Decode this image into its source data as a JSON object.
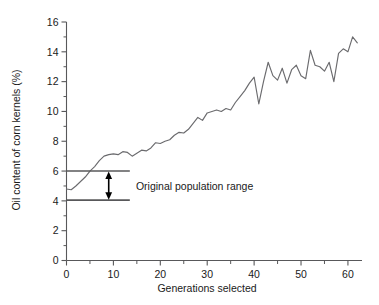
{
  "chart_data": {
    "type": "line",
    "title": "",
    "xlabel": "Generations selected",
    "ylabel": "Oil content of corn kernels (%)",
    "xlim": [
      0,
      63
    ],
    "ylim": [
      0,
      16
    ],
    "xticks": [
      0,
      10,
      20,
      30,
      40,
      50,
      60
    ],
    "xticklabels": [
      "0",
      "10",
      "20",
      "30",
      "40",
      "50",
      "60"
    ],
    "xminorticks": [
      5,
      15,
      25,
      35,
      45,
      55
    ],
    "yticks": [
      0,
      2,
      4,
      6,
      8,
      10,
      12,
      14,
      16
    ],
    "yticklabels": [
      "0",
      "2",
      "4",
      "6",
      "8",
      "10",
      "12",
      "14",
      "16"
    ],
    "yminorticks": [
      1,
      3,
      5,
      7,
      9,
      11,
      13,
      15
    ],
    "grid": false,
    "legend": null,
    "series": [
      {
        "name": "Oil content",
        "color": "#6b6b6e",
        "x": [
          0,
          1,
          2,
          3,
          4,
          5,
          6,
          7,
          8,
          9,
          10,
          11,
          12,
          13,
          14,
          15,
          16,
          17,
          18,
          19,
          20,
          21,
          22,
          23,
          24,
          25,
          26,
          27,
          28,
          29,
          30,
          31,
          32,
          33,
          34,
          35,
          36,
          37,
          38,
          39,
          40,
          41,
          42,
          43,
          44,
          45,
          46,
          47,
          48,
          49,
          50,
          51,
          52,
          53,
          54,
          55,
          56,
          57,
          58,
          59,
          60,
          61,
          62
        ],
        "values": [
          4.8,
          4.75,
          5.0,
          5.3,
          5.6,
          6.0,
          6.3,
          6.7,
          7.0,
          7.1,
          7.15,
          7.1,
          7.3,
          7.25,
          7.0,
          7.2,
          7.4,
          7.35,
          7.55,
          7.9,
          7.85,
          8.0,
          8.1,
          8.4,
          8.6,
          8.55,
          8.8,
          9.2,
          9.6,
          9.4,
          9.9,
          10.0,
          10.1,
          10.0,
          10.2,
          10.1,
          10.6,
          11.0,
          11.4,
          11.9,
          12.3,
          10.5,
          12.0,
          13.3,
          12.4,
          12.1,
          12.9,
          11.9,
          12.8,
          13.1,
          12.4,
          12.2,
          14.1,
          13.1,
          13.0,
          12.7,
          13.3,
          12.0,
          13.9,
          14.2,
          14.0,
          15.0,
          14.6
        ]
      }
    ],
    "annotations": [
      {
        "name": "original-population-range",
        "label": "Original population range",
        "type": "range-bracket",
        "y_top": 6.0,
        "y_bottom": 4.05,
        "x_start": 0,
        "x_end": 13.5,
        "arrow_x": 9.0,
        "label_x": 14.8,
        "label_y": 5.0
      }
    ]
  }
}
